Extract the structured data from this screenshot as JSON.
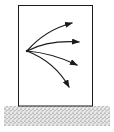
{
  "diagram": {
    "type": "force-diagram",
    "elements": {
      "box": {
        "x": 18,
        "y": 5,
        "width": 75,
        "height": 101
      },
      "ground": {
        "x": 4,
        "y": 106,
        "width": 106,
        "height": 20,
        "fill": "stippled"
      },
      "origin": {
        "x": 27,
        "y": 51
      },
      "arrows": [
        {
          "id": "arrow-1",
          "tip": [
            72,
            23
          ]
        },
        {
          "id": "arrow-2",
          "tip": [
            79,
            42
          ]
        },
        {
          "id": "arrow-3",
          "tip": [
            77,
            65
          ]
        },
        {
          "id": "arrow-4",
          "tip": [
            69,
            87
          ]
        }
      ]
    },
    "colors": {
      "stroke": "#1a1a1a",
      "background": "#ffffff"
    }
  }
}
